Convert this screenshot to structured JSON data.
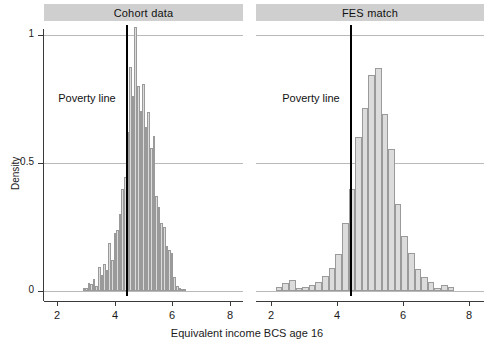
{
  "figure": {
    "xlabel": "Equivalent income BCS age 16",
    "ylabel": "Density",
    "poverty_label_left": "Poverty line",
    "poverty_label_right": "Poverty line"
  },
  "chart_data": {
    "type": "bar",
    "title": "",
    "xlabel": "Equivalent income BCS age 16",
    "ylabel": "Density",
    "xlim": [
      1.55,
      8.45
    ],
    "ylim": [
      -0.045,
      1.08
    ],
    "xticks": [
      2,
      4,
      6,
      8
    ],
    "yticks": [
      0,
      0.5,
      1
    ],
    "ytick_labels": [
      "0",
      "0.5",
      "1"
    ],
    "xtick_labels": [
      "2",
      "4",
      "6",
      "8"
    ],
    "grid": "horizontal gridlines at y=0.5 and y=1, spanning both panels",
    "legend": "none",
    "annotations": [
      {
        "text": "Poverty line",
        "panel": "Cohort data",
        "x": 3.75,
        "y": 0.74
      },
      {
        "text": "Poverty line",
        "panel": "FES match",
        "x": 3.72,
        "y": 0.74
      },
      {
        "type": "vline",
        "x": 4.4,
        "panel": "Cohort data",
        "color": "#000000"
      },
      {
        "type": "vline",
        "x": 4.4,
        "panel": "FES match",
        "color": "#000000"
      }
    ],
    "panels": [
      {
        "name": "Cohort data",
        "bin_width": 0.09,
        "bin_centers": [
          2.93,
          3.02,
          3.11,
          3.2,
          3.29,
          3.38,
          3.47,
          3.56,
          3.65,
          3.74,
          3.83,
          3.92,
          4.01,
          4.1,
          4.19,
          4.28,
          4.37,
          4.46,
          4.55,
          4.64,
          4.73,
          4.82,
          4.91,
          5.0,
          5.09,
          5.18,
          5.27,
          5.36,
          5.45,
          5.54,
          5.63,
          5.72,
          5.81,
          5.9,
          5.99,
          6.08,
          6.17,
          6.26,
          6.35,
          6.44
        ],
        "values": [
          0.012,
          0.01,
          0.03,
          0.026,
          0.048,
          0.018,
          0.092,
          0.062,
          0.105,
          0.082,
          0.186,
          0.122,
          0.225,
          0.24,
          0.3,
          0.4,
          0.445,
          0.62,
          0.875,
          0.76,
          1.03,
          0.8,
          0.705,
          0.81,
          0.64,
          0.7,
          0.56,
          0.605,
          0.37,
          0.33,
          0.265,
          0.25,
          0.175,
          0.16,
          0.15,
          0.055,
          0.02,
          0.012,
          0.008,
          0.008
        ]
      },
      {
        "name": "FES match",
        "bin_width": 0.2,
        "bin_centers": [
          2.25,
          2.45,
          2.65,
          2.85,
          3.05,
          3.25,
          3.45,
          3.65,
          3.85,
          4.05,
          4.25,
          4.45,
          4.65,
          4.85,
          5.05,
          5.25,
          5.45,
          5.65,
          5.85,
          6.05,
          6.25,
          6.45,
          6.65,
          6.85,
          7.05,
          7.25,
          7.45
        ],
        "values": [
          0.015,
          0.03,
          0.042,
          0.012,
          0.016,
          0.022,
          0.035,
          0.06,
          0.09,
          0.145,
          0.265,
          0.4,
          0.6,
          0.715,
          0.845,
          0.87,
          0.69,
          0.555,
          0.34,
          0.215,
          0.15,
          0.085,
          0.055,
          0.035,
          0.012,
          0.022,
          0.016
        ]
      }
    ]
  }
}
